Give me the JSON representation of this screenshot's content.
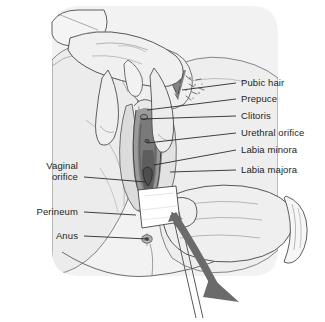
{
  "figure": {
    "width": 325,
    "height": 322,
    "style": "line-art medical illustration",
    "colors": {
      "line": "#231f20",
      "skin_light": "#f0f0f0",
      "skin_mid": "#e0e0e0",
      "shade_dark": "#9a9a9a",
      "shade_darker": "#6f6f6f",
      "arrow": "#6b6b6b",
      "gauze": "#ffffff",
      "background": "#ffffff",
      "text": "#231f20"
    }
  },
  "labels": {
    "right": [
      {
        "text": "Pubic hair",
        "y": 83,
        "line_from_x": 236,
        "line_to_x": 182,
        "line_to_y": 90
      },
      {
        "text": "Prepuce",
        "y": 99,
        "line_from_x": 236,
        "line_to_x": 147,
        "line_to_y": 110
      },
      {
        "text": "Clitoris",
        "y": 116,
        "line_from_x": 236,
        "line_to_x": 141,
        "line_to_y": 119
      },
      {
        "text": "Urethral orifice",
        "y": 133,
        "line_from_x": 236,
        "line_to_x": 147,
        "line_to_y": 143
      },
      {
        "text": "Labia minora",
        "y": 150,
        "line_from_x": 236,
        "line_to_x": 154,
        "line_to_y": 165
      },
      {
        "text": "Labia majora",
        "y": 170,
        "line_from_x": 236,
        "line_to_x": 170,
        "line_to_y": 172
      }
    ],
    "left": [
      {
        "text": "Vaginal",
        "y": 166,
        "x_right": 78,
        "second_line": false
      },
      {
        "text": "orifice",
        "y": 177,
        "x_right": 78,
        "line_from_x": 84,
        "line_to_x": 146,
        "line_to_y": 182
      },
      {
        "text": "Perineum",
        "y": 212,
        "x_right": 78,
        "line_from_x": 84,
        "line_to_x": 136,
        "line_to_y": 215
      },
      {
        "text": "Anus",
        "y": 236,
        "x_right": 78,
        "line_from_x": 84,
        "line_to_x": 148,
        "line_to_y": 239
      }
    ]
  },
  "annotations": {
    "arrow": {
      "name": "wipe-direction-arrow",
      "description": "curved arrow indicating front-to-back downward wiping motion",
      "color": "#6b6b6b"
    },
    "gauze": {
      "name": "gauze-pad",
      "description": "white gauze wipe held between gloved fingers"
    }
  },
  "anatomy_parts": [
    "Pubic hair",
    "Prepuce",
    "Clitoris",
    "Urethral orifice",
    "Labia minora",
    "Labia majora",
    "Vaginal orifice",
    "Perineum",
    "Anus"
  ]
}
